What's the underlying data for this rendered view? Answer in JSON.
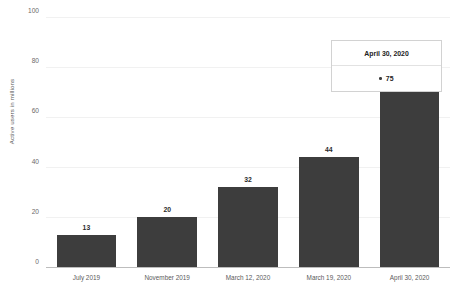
{
  "chart_data": {
    "type": "bar",
    "title": "",
    "xlabel": "",
    "ylabel": "Active users in millions",
    "categories": [
      "July 2019",
      "November 2019",
      "March 12, 2020",
      "March 19, 2020",
      "April 30, 2020"
    ],
    "values": [
      13,
      20,
      32,
      44,
      75
    ],
    "ylim": [
      0,
      100
    ],
    "yticks": [
      0,
      20,
      40,
      60,
      80,
      100
    ],
    "ytick_labels": [
      "0",
      "20",
      "40",
      "60",
      "80",
      "100"
    ],
    "grid": true,
    "legend": "none",
    "bar_color": "#3d3d3d",
    "gridline_color": "#f1f1f1",
    "axis_color": "#bdbdbd"
  },
  "tooltip": {
    "header": "April 30, 2020",
    "value": "75",
    "marker": "bullet-dot"
  }
}
